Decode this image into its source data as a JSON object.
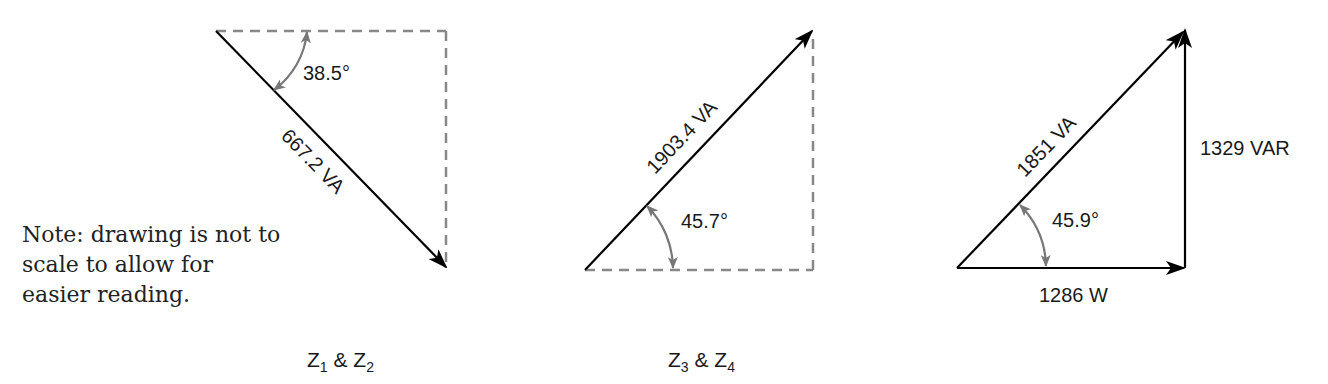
{
  "note": "Note: drawing is not to scale to allow for easier reading.",
  "colors": {
    "vector": "#000000",
    "dashed": "#888888",
    "angle_arc": "#777777"
  },
  "triangles": [
    {
      "id": "z1z2",
      "caption_main1": "Z",
      "caption_sub1": "1",
      "caption_amp": " & Z",
      "caption_sub2": "2",
      "hypotenuse_label": "667.2 VA",
      "angle_label": "38.5°"
    },
    {
      "id": "z3z4",
      "caption_main1": "Z",
      "caption_sub1": "3",
      "caption_amp": " & Z",
      "caption_sub2": "4",
      "hypotenuse_label": "1903.4 VA",
      "angle_label": "45.7°"
    },
    {
      "id": "total",
      "hypotenuse_label": "1851 VA",
      "angle_label": "45.9°",
      "real_label": "1286 W",
      "reactive_label": "1329 VAR"
    }
  ]
}
